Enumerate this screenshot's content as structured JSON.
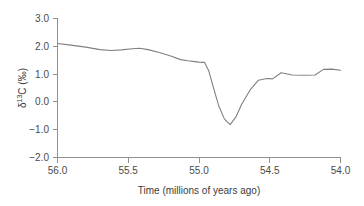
{
  "chart_data": {
    "type": "line",
    "title": "",
    "subtitle": "",
    "xlabel": "Time (millions of years ago)",
    "ylabel": "δ¹³C (‰)",
    "ylabel_parts": {
      "symbol": "δ",
      "superscript": "13",
      "element": "C",
      "units": "(‰)"
    },
    "xlim": [
      56.0,
      54.0
    ],
    "ylim": [
      -2.0,
      3.0
    ],
    "x_reversed": true,
    "grid": false,
    "legend": null,
    "legend_position": "none",
    "line_color": "#808080",
    "axis_color": "#909090",
    "text_color": "#3c3c3c",
    "xticks": [
      56.0,
      55.5,
      55.0,
      54.5,
      54.0
    ],
    "xtick_labels": [
      "56.0",
      "55.5",
      "55.0",
      "54.5",
      "54.0"
    ],
    "yticks": [
      3.0,
      2.0,
      1.0,
      0.0,
      -1.0,
      -2.0
    ],
    "ytick_labels": [
      "3.0",
      "2.0",
      "1.0",
      "0.0",
      "−1.0",
      "−2.0"
    ],
    "series": [
      {
        "name": "δ¹³C record",
        "x": [
          56.0,
          55.92,
          55.8,
          55.7,
          55.62,
          55.55,
          55.47,
          55.42,
          55.36,
          55.28,
          55.2,
          55.13,
          55.08,
          55.03,
          55.0,
          54.98,
          54.96,
          54.93,
          54.9,
          54.86,
          54.82,
          54.78,
          54.74,
          54.7,
          54.64,
          54.58,
          54.52,
          54.48,
          54.42,
          54.34,
          54.26,
          54.18,
          54.12,
          54.06,
          54.0
        ],
        "y": [
          2.1,
          2.05,
          1.97,
          1.88,
          1.85,
          1.87,
          1.91,
          1.93,
          1.88,
          1.78,
          1.65,
          1.52,
          1.48,
          1.45,
          1.43,
          1.42,
          1.42,
          1.1,
          0.55,
          -0.15,
          -0.62,
          -0.82,
          -0.55,
          -0.1,
          0.42,
          0.78,
          0.84,
          0.83,
          1.05,
          0.97,
          0.96,
          0.97,
          1.17,
          1.18,
          1.14
        ]
      }
    ],
    "annotations": [
      {
        "name": "carbon-isotope-excursion",
        "x": 55.08,
        "y": -0.82,
        "label": ""
      }
    ]
  },
  "figure": {
    "background": "#ffffff",
    "width": 364,
    "height": 206
  }
}
